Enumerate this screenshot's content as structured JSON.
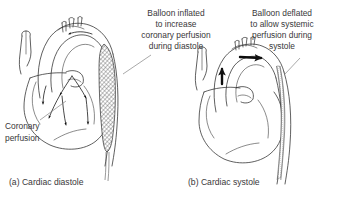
{
  "figure": {
    "background_color": "#ffffff",
    "ink_color": "#2b2b2b",
    "text_color": "#39383a"
  },
  "panels": [
    {
      "id": "panel-a",
      "caption": "(a) Cardiac diastole",
      "annotation": {
        "lines": [
          "Balloon inflated",
          "to increase",
          "coronary perfusion",
          "during diastole"
        ],
        "align": "center"
      },
      "secondary_annotation": {
        "lines": [
          "Coronary",
          "perfusion"
        ],
        "align": "left"
      },
      "balloon_state": "inflated",
      "balloon_fill": "cross-hatched",
      "flow_direction": "retrograde-coronary"
    },
    {
      "id": "panel-b",
      "caption": "(b) Cardiac systole",
      "annotation": {
        "lines": [
          "Balloon deflated",
          "to allow systemic",
          "perfusion during",
          "systole"
        ],
        "align": "center"
      },
      "balloon_state": "deflated",
      "balloon_fill": "stippled-thin",
      "flow_direction": "antegrade-systemic"
    }
  ],
  "icons": {
    "arrowhead": "flow-arrow-icon",
    "bold_arrow": "bold-flow-arrow-icon",
    "leader_line": "leader-line-icon"
  }
}
